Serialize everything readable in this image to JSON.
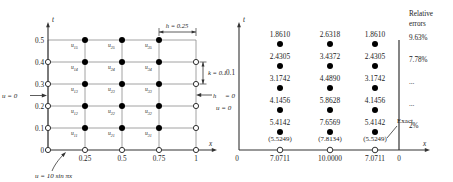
{
  "figure": {
    "left_panel": {
      "title_hidden": "",
      "axes": {
        "y_name": "t",
        "x_name": "x",
        "y_ticks": [
          "0.5",
          "0.4",
          "0.3",
          "0.2",
          "0.1",
          "0"
        ],
        "x_ticks": [
          "0.25",
          "0.5",
          "0.75",
          "1"
        ]
      },
      "boundary_left": "u = 0",
      "boundary_right": "u = 0",
      "initial_condition": "u = 10 sin πx",
      "h_label": "h = 0.25",
      "k_label": "k = 0.1",
      "h_arrow_label": "h",
      "node_rows": [
        {
          "t": "0.5",
          "labels": [
            "u",
            "u",
            "u"
          ],
          "subs": [
            "15",
            "25",
            "35"
          ]
        },
        {
          "t": "0.4",
          "labels": [
            "u",
            "u",
            "u"
          ],
          "subs": [
            "14",
            "24",
            "34"
          ]
        },
        {
          "t": "0.3",
          "labels": [
            "u",
            "u",
            "u"
          ],
          "subs": [
            "13",
            "23",
            "33"
          ]
        },
        {
          "t": "0.2",
          "labels": [
            "u",
            "u",
            "u"
          ],
          "subs": [
            "12",
            "22",
            "32"
          ]
        },
        {
          "t": "0.1",
          "labels": [
            "u",
            "u",
            "u"
          ],
          "subs": [
            "11",
            "21",
            "31"
          ]
        }
      ]
    },
    "right_panel": {
      "axes": {
        "y_name": "t",
        "x_name": "x",
        "origin_label": "0",
        "right_origin_label": "0",
        "y_tick_partial": "0.1",
        "boundary_partial": "= 0"
      },
      "value_rows": [
        {
          "t": "0.5",
          "values": [
            "1.8610",
            "2.6318",
            "1.8610"
          ],
          "exact": [
            "",
            "",
            ""
          ],
          "error": "9.63%"
        },
        {
          "t": "0.4",
          "values": [
            "2.4305",
            "3.4372",
            "2.4305"
          ],
          "exact": [
            "",
            "",
            ""
          ],
          "error": "7.78%"
        },
        {
          "t": "0.3",
          "values": [
            "3.1742",
            "4.4890",
            "3.1742"
          ],
          "exact": [
            "",
            "",
            ""
          ],
          "error": "..."
        },
        {
          "t": "0.2",
          "values": [
            "4.1456",
            "5.8628",
            "4.1456"
          ],
          "exact": [
            "",
            "",
            ""
          ],
          "error": "..."
        },
        {
          "t": "0.1",
          "values": [
            "5.4142",
            "7.6569",
            "5.4142"
          ],
          "exact": [
            "(5.5249)",
            "(7.8134)",
            "(5.5249)"
          ],
          "error": "2%"
        }
      ],
      "initial_values": [
        "7.0711",
        "10.0000",
        "7.0711"
      ],
      "exact_callout": "Exact",
      "error_heading_line1": "Relative",
      "error_heading_line2": "errors"
    }
  },
  "colors": {
    "ink": "#1a1a1a",
    "grid": "#8a8a8a",
    "axis": "#444444",
    "node_fill": "#000000",
    "open_node_fill": "#ffffff",
    "background": "#ffffff"
  }
}
